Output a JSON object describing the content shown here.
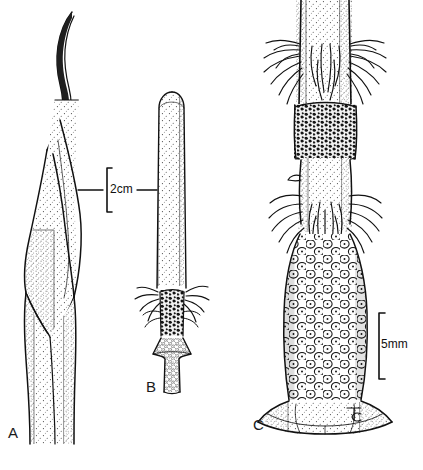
{
  "plate": {
    "kind": "botanical-line-illustration",
    "background_color": "#ffffff",
    "ink_color": "#111111",
    "width": 423,
    "height": 470
  },
  "figures": [
    {
      "id": "A",
      "label": "A",
      "name": "spathe-with-spadix",
      "description": "Tall slender spathe with a long curved tapering apex, a swollen stippled ovate mid-section, and a tubular basal sheath",
      "scale_ref": "2cm"
    },
    {
      "id": "B",
      "label": "B",
      "name": "whole-spadix",
      "description": "Slender club-shaped spadix: rounded stippled apex, a hairy whorl and dark granular band near the lower third, and a flared stippled base",
      "scale_ref": "2cm"
    },
    {
      "id": "C",
      "label": "C",
      "name": "spadix-detail-enlarged",
      "description": "Enlarged detail of the spadix base: stippled stem with radiating hairs, a dark verrucose band, a second hairy whorl, a zone of rounded dotted cells, and a flared basal bract",
      "scale_ref": "5mm"
    }
  ],
  "scale_bars": [
    {
      "id": "scale-2cm",
      "label": "2cm",
      "orientation": "vertical-bracket-with-leaders",
      "applies_to": [
        "A",
        "B"
      ]
    },
    {
      "id": "scale-5mm",
      "label": "5mm",
      "orientation": "vertical-bracket",
      "applies_to": [
        "C"
      ]
    }
  ]
}
